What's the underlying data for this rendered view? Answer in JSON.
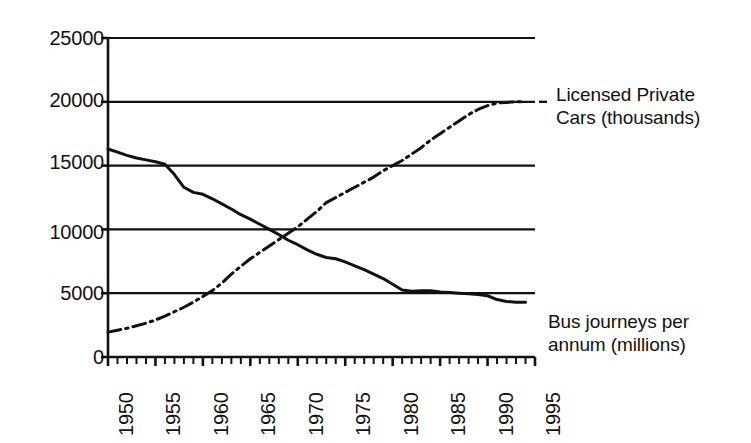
{
  "chart_data": {
    "type": "line",
    "title": "",
    "subtitle": "",
    "xlabel": "",
    "ylabel": "",
    "xlim": [
      1950,
      1995
    ],
    "ylim": [
      0,
      25000
    ],
    "grid": true,
    "grid_axis": "y",
    "legend_position": "right-inline-annotations",
    "x_tick_labels": [
      "1950",
      "1955",
      "1960",
      "1965",
      "1970",
      "1975",
      "1980",
      "1985",
      "1990",
      "1995"
    ],
    "x_tick_values": [
      1950,
      1955,
      1960,
      1965,
      1970,
      1975,
      1980,
      1985,
      1990,
      1995
    ],
    "x_minor_tick_step": 1,
    "y_tick_labels": [
      "0",
      "5000",
      "10000",
      "15000",
      "20000",
      "25000"
    ],
    "y_tick_values": [
      0,
      5000,
      10000,
      15000,
      20000,
      25000
    ],
    "x": [
      1950,
      1951,
      1952,
      1953,
      1954,
      1955,
      1956,
      1957,
      1958,
      1959,
      1960,
      1961,
      1962,
      1963,
      1964,
      1965,
      1966,
      1967,
      1968,
      1969,
      1970,
      1971,
      1972,
      1973,
      1974,
      1975,
      1976,
      1977,
      1978,
      1979,
      1980,
      1981,
      1982,
      1983,
      1984,
      1985,
      1986,
      1987,
      1988,
      1989,
      1990,
      1991,
      1992,
      1993,
      1994
    ],
    "series": [
      {
        "name": "Bus journeys per annum (millions)",
        "style": "solid",
        "color": "#111111",
        "annotation": "Bus journeys per\nannum (millions)",
        "values": [
          16300,
          16050,
          15800,
          15600,
          15450,
          15300,
          15100,
          14300,
          13300,
          12900,
          12750,
          12400,
          12000,
          11600,
          11150,
          10800,
          10400,
          10000,
          9600,
          9150,
          8800,
          8400,
          8050,
          7800,
          7700,
          7450,
          7150,
          6850,
          6500,
          6150,
          5700,
          5250,
          5150,
          5200,
          5200,
          5100,
          5050,
          5000,
          4950,
          4900,
          4800,
          4500,
          4350,
          4300,
          4300
        ]
      },
      {
        "name": "Licensed Private Cars (thousands)",
        "style": "dash-dot",
        "color": "#111111",
        "annotation": "Licensed Private\nCars (thousands)",
        "values": [
          1950,
          2100,
          2250,
          2450,
          2650,
          2900,
          3200,
          3550,
          3900,
          4300,
          4750,
          5200,
          5800,
          6500,
          7100,
          7700,
          8200,
          8700,
          9200,
          9700,
          10200,
          10800,
          11400,
          12100,
          12500,
          12900,
          13300,
          13700,
          14100,
          14600,
          15000,
          15400,
          15900,
          16400,
          17000,
          17500,
          18000,
          18500,
          19000,
          19400,
          19700,
          19900,
          19950,
          20000,
          20000
        ]
      }
    ]
  },
  "axis": {
    "y_labels": [
      "25000",
      "20000",
      "15000",
      "10000",
      "5000",
      "0"
    ],
    "x_labels": [
      "1950",
      "1955",
      "1960",
      "1965",
      "1970",
      "1975",
      "1980",
      "1985",
      "1990",
      "1995"
    ]
  },
  "annotations": {
    "top_right_line1": "Licensed Private",
    "top_right_line2": "Cars (thousands)",
    "bottom_right_line1": "Bus journeys per",
    "bottom_right_line2": "annum (millions)"
  },
  "colors": {
    "ink": "#111111",
    "background": "#ffffff"
  }
}
